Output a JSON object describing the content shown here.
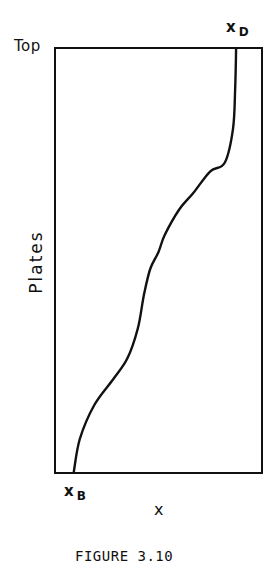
{
  "figure": {
    "caption": "FIGURE 3.10",
    "top_label": "Top",
    "ylabel": "Plates",
    "xlabel": "x",
    "start_label": {
      "main": "x",
      "sub": "B"
    },
    "end_label": {
      "main": "x",
      "sub": "D"
    }
  },
  "chart_data": {
    "type": "line",
    "title": "FIGURE 3.10",
    "xlabel": "x",
    "ylabel": "Plates",
    "annotations": [
      "Top",
      "x_B",
      "x_D"
    ],
    "grid": false,
    "legend": null,
    "x_range": [
      0,
      1
    ],
    "y_range": [
      0,
      1
    ],
    "series": [
      {
        "name": "composition profile",
        "x": [
          0.09,
          0.12,
          0.19,
          0.28,
          0.35,
          0.4,
          0.43,
          0.46,
          0.5,
          0.53,
          0.6,
          0.67,
          0.75,
          0.82,
          0.86,
          0.87,
          0.875
        ],
        "y": [
          0.0,
          0.08,
          0.16,
          0.22,
          0.27,
          0.34,
          0.42,
          0.48,
          0.52,
          0.56,
          0.62,
          0.66,
          0.71,
          0.73,
          0.81,
          0.9,
          1.0
        ]
      }
    ]
  }
}
